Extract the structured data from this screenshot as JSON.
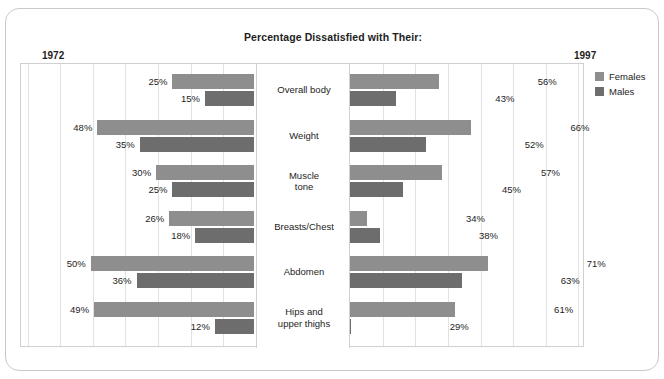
{
  "card": {
    "title": "Percentage Dissatisfied with Their:"
  },
  "axis": {
    "year_left": "1972",
    "year_right": "1997"
  },
  "legend": {
    "items": [
      {
        "label": "Females",
        "color": "#8e8e8e",
        "key": "females"
      },
      {
        "label": "Males",
        "color": "#6d6d6d",
        "key": "males"
      }
    ]
  },
  "chart_data": {
    "type": "bar",
    "title": "Percentage Dissatisfied with Their:",
    "subtype": "bidirectional-paired-bar",
    "xlabel": "",
    "ylabel": "",
    "xlim": [
      0,
      75
    ],
    "grid": true,
    "grid_step": 10,
    "legend_position": "right",
    "panels": [
      {
        "name": "1972",
        "side": "left"
      },
      {
        "name": "1997",
        "side": "right"
      }
    ],
    "categories": [
      "Overall body",
      "Weight",
      "Muscle tone",
      "Breasts/Chest",
      "Abdomen",
      "Hips and upper thighs"
    ],
    "series": [
      {
        "name": "Females",
        "panel": "1972",
        "color": "#8e8e8e",
        "values": [
          25,
          48,
          30,
          26,
          50,
          49
        ],
        "labels": [
          "25%",
          "48%",
          "30%",
          "26%",
          "50%",
          "49%"
        ]
      },
      {
        "name": "Males",
        "panel": "1972",
        "color": "#6d6d6d",
        "values": [
          15,
          35,
          25,
          18,
          36,
          12
        ],
        "labels": [
          "15%",
          "35%",
          "25%",
          "18%",
          "36%",
          "12%"
        ]
      },
      {
        "name": "Females",
        "panel": "1997",
        "color": "#8e8e8e",
        "values": [
          56,
          66,
          57,
          34,
          71,
          61
        ],
        "labels": [
          "56%",
          "66%",
          "57%",
          "34%",
          "71%",
          "61%"
        ]
      },
      {
        "name": "Males",
        "panel": "1997",
        "color": "#6d6d6d",
        "values": [
          43,
          52,
          45,
          38,
          63,
          29
        ],
        "labels": [
          "43%",
          "52%",
          "45%",
          "38%",
          "63%",
          "29%"
        ]
      }
    ]
  },
  "rows": [
    {
      "category_lines": [
        "Overall body"
      ],
      "left": {
        "females": "25%",
        "males": "15%"
      },
      "right": {
        "females": "56%",
        "males": "43%"
      }
    },
    {
      "category_lines": [
        "Weight"
      ],
      "left": {
        "females": "48%",
        "males": "35%"
      },
      "right": {
        "females": "66%",
        "males": "52%"
      }
    },
    {
      "category_lines": [
        "Muscle",
        "tone"
      ],
      "left": {
        "females": "30%",
        "males": "25%"
      },
      "right": {
        "females": "57%",
        "males": "45%"
      }
    },
    {
      "category_lines": [
        "Breasts/Chest"
      ],
      "left": {
        "females": "26%",
        "males": "18%"
      },
      "right": {
        "females": "34%",
        "males": "38%"
      }
    },
    {
      "category_lines": [
        "Abdomen"
      ],
      "left": {
        "females": "50%",
        "males": "36%"
      },
      "right": {
        "females": "71%",
        "males": "63%"
      }
    },
    {
      "category_lines": [
        "Hips and",
        "upper thighs"
      ],
      "left": {
        "females": "49%",
        "males": "12%"
      },
      "right": {
        "females": "61%",
        "males": "29%"
      }
    }
  ]
}
